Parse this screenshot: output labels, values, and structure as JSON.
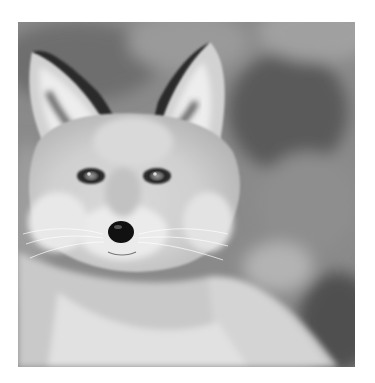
{
  "image": {
    "subject": "red fox portrait",
    "style": "grayscale photograph",
    "alt": "Close-up grayscale portrait of a fox facing the camera"
  },
  "colors": {
    "page_background": "#ffffff",
    "photo_background_dark": "#5e5e5e",
    "photo_background_mid": "#8c8c8c",
    "fur_light": "#e6e6e6",
    "fur_mid": "#bdbdbd",
    "nose": "#111111"
  }
}
